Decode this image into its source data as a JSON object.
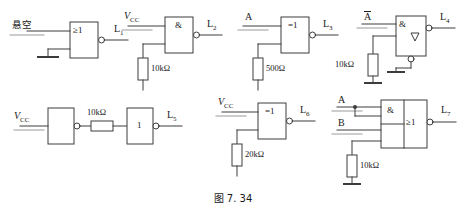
{
  "figure": {
    "caption": "图 7. 34",
    "stroke_color": "#3c3c3c",
    "text_color": "#1a1a1a",
    "background": "#ffffff"
  },
  "circuits": [
    {
      "id": "circuit-1",
      "input_label": "悬空",
      "input_label_meaning": "floating",
      "gate_symbol": "≥1",
      "gate_type": "NOR",
      "output_label": "L",
      "output_subscript": "1",
      "has_output_bubble": true,
      "has_ground": true,
      "resistor": null
    },
    {
      "id": "circuit-2",
      "input_label": "V",
      "input_subscript": "CC",
      "gate_symbol": "&",
      "gate_type": "NAND",
      "output_label": "L",
      "output_subscript": "2",
      "has_output_bubble": true,
      "has_ground": true,
      "resistor": "10kΩ"
    },
    {
      "id": "circuit-3",
      "input_label": "A",
      "gate_symbol": "=1",
      "gate_type": "XNOR",
      "output_label": "L",
      "output_subscript": "3",
      "has_output_bubble": true,
      "has_ground": true,
      "resistor": "500Ω"
    },
    {
      "id": "circuit-4",
      "input_label": "A",
      "input_overbar": true,
      "gate_symbol": "&",
      "gate_extra_symbol": "▽",
      "gate_type": "open-collector NAND",
      "output_label": "L",
      "output_subscript": "4",
      "has_output_bubble": true,
      "has_enable_bubble": true,
      "has_ground": true,
      "resistor": "10kΩ"
    },
    {
      "id": "circuit-5",
      "input_label": "V",
      "input_subscript": "CC",
      "gate_symbol": "",
      "gate2_symbol": "1",
      "gate_type": "buffer chain",
      "output_label": "L",
      "output_subscript": "5",
      "has_output_bubble": true,
      "has_ground": false,
      "resistor": "10kΩ"
    },
    {
      "id": "circuit-6",
      "input_label": "V",
      "input_subscript": "CC",
      "gate_symbol": "=1",
      "gate_type": "XNOR",
      "output_label": "L",
      "output_subscript": "6",
      "has_output_bubble": true,
      "has_ground": true,
      "resistor": "20kΩ"
    },
    {
      "id": "circuit-7",
      "input_label_a": "A",
      "input_label_b": "B",
      "gate_symbol": "&",
      "gate2_symbol": "≥1",
      "gate_type": "AND-OR-INVERT",
      "output_label": "L",
      "output_subscript": "7",
      "has_output_bubble": true,
      "has_ground": true,
      "has_junction_dot": true,
      "resistor": "10kΩ"
    }
  ]
}
